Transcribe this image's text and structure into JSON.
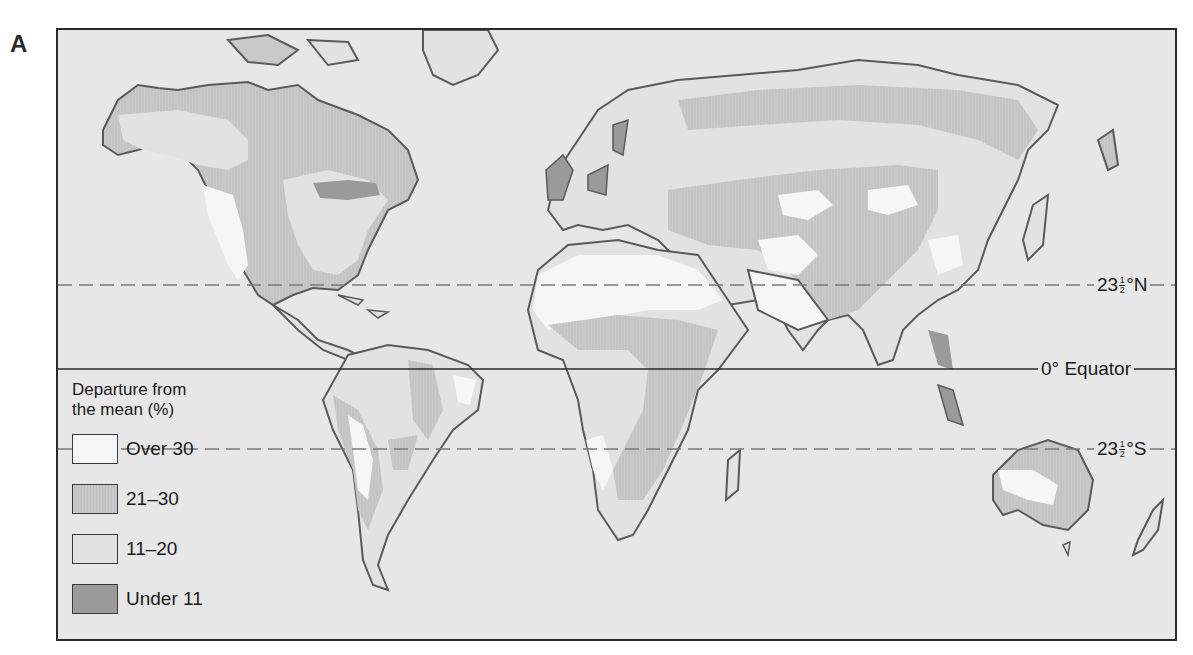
{
  "panel_label": "A",
  "map": {
    "title": "Precipitation variability: departure from the mean",
    "projection_frame": {
      "left": 56,
      "top": 28,
      "width": 1121,
      "height": 613
    },
    "reference_lines": [
      {
        "id": "tropic-cancer",
        "label_main": "23",
        "label_frac_num": "1",
        "label_frac_den": "2",
        "label_suffix": "°N",
        "style": "dashed",
        "y": 283
      },
      {
        "id": "equator",
        "label_main": "0° Equator",
        "style": "solid",
        "y": 367
      },
      {
        "id": "tropic-capricorn",
        "label_main": "23",
        "label_frac_num": "1",
        "label_frac_den": "2",
        "label_suffix": "°S",
        "style": "dashed",
        "y": 447
      }
    ],
    "colors": {
      "ocean": "#e7e7e7",
      "coastline": "#5a5a5a",
      "frame": "#2b2b2b",
      "over_30": "#f6f6f6",
      "c21_30": "#c9c9c9",
      "c11_20": "#e2e2e2",
      "under_11": "#9a9a9a"
    }
  },
  "legend": {
    "title_line1": "Departure from",
    "title_line2": "the mean (%)",
    "items": [
      {
        "label": "Over 30",
        "color": "#f6f6f6"
      },
      {
        "label": "21–30",
        "color": "#c9c9c9"
      },
      {
        "label": "11–20",
        "color": "#e2e2e2"
      },
      {
        "label": "Under 11",
        "color": "#9a9a9a"
      }
    ]
  }
}
